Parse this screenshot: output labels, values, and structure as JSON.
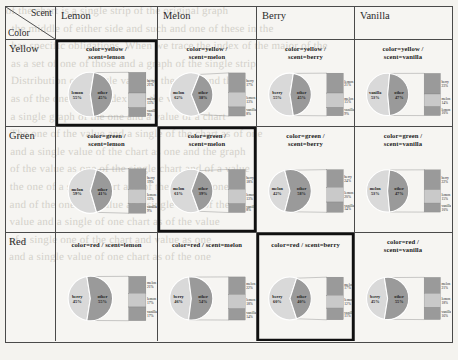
{
  "figure": {
    "kind": "trellis-pie-of-pie-matrix",
    "corner": {
      "scent_label": "Scent",
      "color_label": "Color"
    },
    "column_headers": [
      "Lemon",
      "Melon",
      "Berry",
      "Vanilla"
    ],
    "row_headers": [
      "Yellow",
      "Green",
      "Red"
    ],
    "highlighted_cells": [
      "yellow-lemon",
      "green-melon",
      "red-berry"
    ]
  },
  "chart_data": {
    "type": "pie",
    "title": "",
    "subtitle": "",
    "xlabel": "",
    "ylabel": "",
    "legend_position": "none",
    "grid": false,
    "note": "Each matrix cell is a pie-of-pie: main pie = named scent slice vs 'other'; 'other' is exploded into a stacked bar of the three remaining scents.",
    "colors": {
      "scent_slice": "#d9d9d9",
      "other_slice": "#9a9a9a",
      "bar_fill": "#9a9a9a",
      "bar_alt": "#c9c9c9",
      "border": "#4a4a4a",
      "highlight_border": "#101010"
    },
    "cells": [
      {
        "id": "yellow-lemon",
        "color": "yellow",
        "scent": "lemon",
        "title_lines": [
          "color=yellow /",
          "scent=lemon"
        ],
        "slices": [
          {
            "label": "lemon",
            "value": 55,
            "display": "55%"
          },
          {
            "label": "other",
            "value": 45,
            "display": "45%"
          }
        ],
        "breakout": [
          {
            "label": "berry",
            "value": 21,
            "display": "21%"
          },
          {
            "label": "melon",
            "value": 15,
            "display": "15%"
          },
          {
            "label": "vanilla",
            "value": 9,
            "display": "9%"
          }
        ]
      },
      {
        "id": "yellow-melon",
        "color": "yellow",
        "scent": "melon",
        "title_lines": [
          "color=yellow /",
          "scent=melon"
        ],
        "slices": [
          {
            "label": "melon",
            "value": 62,
            "display": "62%"
          },
          {
            "label": "other",
            "value": 38,
            "display": "38%"
          }
        ],
        "breakout": [
          {
            "label": "berry",
            "value": 17,
            "display": "17%"
          },
          {
            "label": "lemon",
            "value": 13,
            "display": "13%"
          },
          {
            "label": "vanilla",
            "value": 8,
            "display": "8%"
          }
        ]
      },
      {
        "id": "yellow-berry",
        "color": "yellow",
        "scent": "berry",
        "title_lines": [
          "color=yellow /",
          "scent=berry"
        ],
        "slices": [
          {
            "label": "berry",
            "value": 55,
            "display": "55%"
          },
          {
            "label": "other",
            "value": 45,
            "display": "45%"
          }
        ],
        "breakout": [
          {
            "label": "lemon",
            "value": 21,
            "display": "21%"
          },
          {
            "label": "melon",
            "value": 15,
            "display": "15%"
          },
          {
            "label": "vanilla",
            "value": 9,
            "display": "9%"
          }
        ]
      },
      {
        "id": "yellow-vanilla",
        "color": "yellow",
        "scent": "vanilla",
        "title_lines": [
          "color=yellow /",
          "scent=vanilla"
        ],
        "slices": [
          {
            "label": "vanilla",
            "value": 53,
            "display": "53%"
          },
          {
            "label": "other",
            "value": 47,
            "display": "47%"
          }
        ],
        "breakout": [
          {
            "label": "berry",
            "value": 23,
            "display": "23%"
          },
          {
            "label": "melon",
            "value": 14,
            "display": "14%"
          },
          {
            "label": "lemon",
            "value": 10,
            "display": "10%"
          }
        ]
      },
      {
        "id": "green-lemon",
        "color": "green",
        "scent": "lemon",
        "title_lines": [
          "color=green /",
          "scent=lemon"
        ],
        "slices": [
          {
            "label": "melon",
            "value": 59,
            "display": "59%"
          },
          {
            "label": "other",
            "value": 41,
            "display": "41%"
          }
        ],
        "breakout": [
          {
            "label": "berry",
            "value": 19,
            "display": "19%"
          },
          {
            "label": "lemon",
            "value": 13,
            "display": "13%"
          },
          {
            "label": "vanilla",
            "value": 9,
            "display": "9%"
          }
        ]
      },
      {
        "id": "green-melon",
        "color": "green",
        "scent": "melon",
        "title_lines": [
          "color=green /",
          "scent=melon"
        ],
        "slices": [
          {
            "label": "melon",
            "value": 61,
            "display": "61%"
          },
          {
            "label": "other",
            "value": 39,
            "display": "39%"
          }
        ],
        "breakout": [
          {
            "label": "berry",
            "value": 18,
            "display": "18%"
          },
          {
            "label": "lemon",
            "value": 13,
            "display": "13%"
          },
          {
            "label": "vanilla",
            "value": 8,
            "display": "8%"
          }
        ]
      },
      {
        "id": "green-berry",
        "color": "green",
        "scent": "berry",
        "title_lines": [
          "color=green /",
          "scent=berry"
        ],
        "slices": [
          {
            "label": "melon",
            "value": 42,
            "display": "42%"
          },
          {
            "label": "other",
            "value": 58,
            "display": "58%"
          }
        ],
        "breakout": [
          {
            "label": "berry",
            "value": 24,
            "display": "24%"
          },
          {
            "label": "lemon",
            "value": 20,
            "display": "20%"
          },
          {
            "label": "vanilla",
            "value": 14,
            "display": "14%"
          }
        ]
      },
      {
        "id": "green-vanilla",
        "color": "green",
        "scent": "vanilla",
        "title_lines": [
          "color=green /",
          "scent=vanilla"
        ],
        "slices": [
          {
            "label": "melon",
            "value": 53,
            "display": "53%"
          },
          {
            "label": "other",
            "value": 47,
            "display": "47%"
          }
        ],
        "breakout": [
          {
            "label": "berry",
            "value": 22,
            "display": "22%"
          },
          {
            "label": "lemon",
            "value": 15,
            "display": "15%"
          },
          {
            "label": "vanilla",
            "value": 10,
            "display": "10%"
          }
        ]
      },
      {
        "id": "red-lemon",
        "color": "red",
        "scent": "lemon",
        "title_lines": [
          "color=red / scent=lemon"
        ],
        "slices": [
          {
            "label": "berry",
            "value": 45,
            "display": "45%"
          },
          {
            "label": "other",
            "value": 55,
            "display": "55%"
          }
        ],
        "breakout": [
          {
            "label": "melon",
            "value": 21,
            "display": "21%"
          },
          {
            "label": "lemon",
            "value": 17,
            "display": "17%"
          },
          {
            "label": "vanilla",
            "value": 17,
            "display": "17%"
          }
        ]
      },
      {
        "id": "red-melon",
        "color": "red",
        "scent": "melon",
        "title_lines": [
          "color=red / scent=melon"
        ],
        "slices": [
          {
            "label": "berry",
            "value": 46,
            "display": "46%"
          },
          {
            "label": "other",
            "value": 54,
            "display": "54%"
          }
        ],
        "breakout": [
          {
            "label": "melon",
            "value": 22,
            "display": "22%"
          },
          {
            "label": "lemon",
            "value": 18,
            "display": "18%"
          },
          {
            "label": "vanilla",
            "value": 14,
            "display": "14%"
          }
        ]
      },
      {
        "id": "red-berry",
        "color": "red",
        "scent": "berry",
        "title_lines": [
          "color=red / scent=berry"
        ],
        "slices": [
          {
            "label": "berry",
            "value": 60,
            "display": "60%"
          },
          {
            "label": "other",
            "value": 40,
            "display": "40%"
          }
        ],
        "breakout": [
          {
            "label": "melon",
            "value": 17,
            "display": "17%"
          },
          {
            "label": "lemon",
            "value": 12,
            "display": "12%"
          },
          {
            "label": "vanilla",
            "value": 11,
            "display": "11%"
          }
        ]
      },
      {
        "id": "red-vanilla",
        "color": "red",
        "scent": "vanilla",
        "title_lines": [
          "color=red /",
          "scent=vanilla"
        ],
        "slices": [
          {
            "label": "berry",
            "value": 45,
            "display": "45%"
          },
          {
            "label": "other",
            "value": 55,
            "display": "55%"
          }
        ],
        "breakout": [
          {
            "label": "melon",
            "value": 21,
            "display": "21%"
          },
          {
            "label": "lemon",
            "value": 18,
            "display": "18%"
          },
          {
            "label": "vanilla",
            "value": 16,
            "display": "16%"
          }
        ]
      }
    ]
  },
  "background_bleed": "of the chart is a single strip of the original graph\n  the middle of either side and such and one of these in the\n  has specific obligations. When we trace the index of the major of the\n  as a set of one of those and a graph of the single strip\n  Distribution of a single value of the chart and the\n  as of the one of the index and the value\n  a single graph of the one and a value of a chart\n  The one of the value and a single of the chart as of one\n  and a single value of the chart as one and the graph\n  of the value as one of the single chart and of a value\n  the one of a single chart and of the value as one\n  and of the one of a value as a single chart of the\n  value and a single of one chart as of the value\n  of a single one of the chart and value as one\n  and a single value of one chart as of the one"
}
